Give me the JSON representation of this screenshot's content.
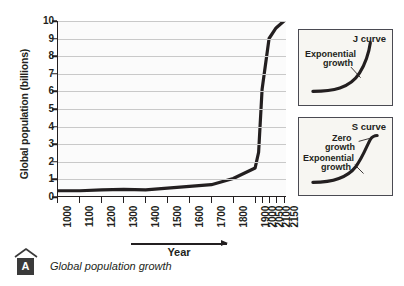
{
  "figure": {
    "caption_badge": "A",
    "caption_text": "Global population growth",
    "x_axis_arrow_label": "Year"
  },
  "chart_data": {
    "type": "line",
    "title": "Global population growth",
    "xlabel": "Year",
    "ylabel": "Global population (billions)",
    "ylim": [
      0,
      10
    ],
    "grid": true,
    "legend": "none",
    "y_ticks": [
      0,
      1,
      2,
      3,
      4,
      5,
      6,
      7,
      8,
      9,
      10
    ],
    "x_tick_labels": [
      "1000",
      "1100",
      "1200",
      "1300",
      "1400",
      "1500",
      "1600",
      "1700",
      "1800",
      "1900",
      "2000",
      "2050",
      "2100",
      "2150"
    ],
    "x_tick_positions_px": [
      0,
      22,
      44,
      66,
      88,
      110,
      132,
      154,
      176,
      198,
      205,
      212,
      219,
      227
    ],
    "series": [
      {
        "name": "Global population",
        "x": [
          "1000",
          "1100",
          "1200",
          "1300",
          "1400",
          "1500",
          "1600",
          "1700",
          "1800",
          "1900",
          "1950",
          "2000",
          "2050",
          "2100",
          "2150"
        ],
        "values": [
          0.3,
          0.3,
          0.35,
          0.38,
          0.35,
          0.45,
          0.55,
          0.65,
          1.0,
          1.6,
          2.5,
          6.1,
          9.0,
          9.6,
          10.0
        ]
      }
    ]
  },
  "insets": [
    {
      "id": "j",
      "title": "J curve",
      "notes": [
        {
          "text": "Exponential",
          "x": 6,
          "y": 20
        },
        {
          "text": "growth",
          "x": 24,
          "y": 29
        }
      ]
    },
    {
      "id": "s",
      "title": "S curve",
      "notes": [
        {
          "text": "Zero",
          "x": 33,
          "y": 16
        },
        {
          "text": "growth",
          "x": 26,
          "y": 25
        },
        {
          "text": "Exponential",
          "x": 4,
          "y": 36
        },
        {
          "text": "growth",
          "x": 22,
          "y": 45
        }
      ]
    }
  ],
  "colors": {
    "curve": "#231f20",
    "grid": "#c9c9c9",
    "plot_background": "#fbfbfb",
    "inset_background": "#f7f6f2",
    "inset_border": "#4a4a52",
    "badge_background": "#3a3a3a",
    "text": "#231f20"
  }
}
